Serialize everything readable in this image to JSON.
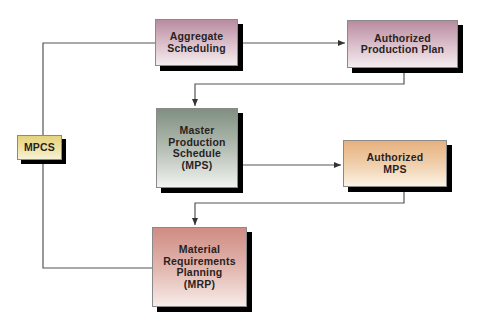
{
  "diagram": {
    "nodes": [
      {
        "id": "mpcs",
        "label": "MPCS"
      },
      {
        "id": "aggregate",
        "label": "Aggregate\nScheduling"
      },
      {
        "id": "app",
        "label": "Authorized\nProduction Plan"
      },
      {
        "id": "mps",
        "label": "Master\nProduction\nSchedule\n(MPS)"
      },
      {
        "id": "amps",
        "label": "Authorized\nMPS"
      },
      {
        "id": "mrp",
        "label": "Material\nRequirements\nPlanning\n(MRP)"
      }
    ],
    "edges": [
      {
        "from": "mpcs",
        "to": "aggregate",
        "type": "line"
      },
      {
        "from": "mpcs",
        "to": "mrp",
        "type": "line"
      },
      {
        "from": "aggregate",
        "to": "app",
        "type": "arrow"
      },
      {
        "from": "app",
        "to": "mps",
        "type": "arrow"
      },
      {
        "from": "mps",
        "to": "amps",
        "type": "arrow"
      },
      {
        "from": "amps",
        "to": "mrp",
        "type": "arrow"
      }
    ],
    "colors": {
      "aggregate": "#c9a3b4",
      "app": "#d9bcc8",
      "mps": "#9aa89a",
      "amps": "#ecc49a",
      "mrp": "#d9a59d",
      "mpcs": "#ecdc96",
      "shadow": "#000000",
      "line": "#444444"
    }
  }
}
